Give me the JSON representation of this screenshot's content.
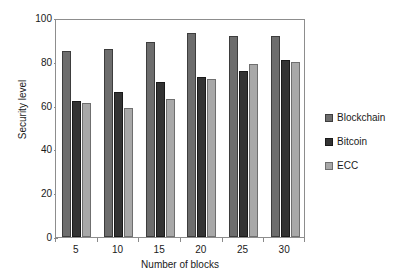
{
  "chart_data": {
    "type": "bar",
    "title": "",
    "xlabel": "Number of blocks",
    "ylabel": "Security level",
    "categories": [
      "5",
      "10",
      "15",
      "20",
      "25",
      "30"
    ],
    "series": [
      {
        "name": "Blockchain",
        "color": "#6d6d6d",
        "values": [
          85,
          86,
          89,
          93,
          92,
          92
        ]
      },
      {
        "name": "Bitcoin",
        "color": "#333333",
        "values": [
          62,
          66,
          71,
          73,
          76,
          81
        ]
      },
      {
        "name": "ECC",
        "color": "#a8a8a8",
        "values": [
          61,
          59,
          63,
          72,
          79,
          80
        ]
      }
    ],
    "ylim": [
      0,
      100
    ],
    "yticks": [
      0,
      20,
      40,
      60,
      80,
      100
    ],
    "ytick_labels": [
      "0",
      "20",
      "40",
      "60",
      "80",
      "100"
    ],
    "grid": false,
    "legend_position": "right",
    "frame": true
  },
  "legend": {
    "entries": [
      {
        "label": "Blockchain"
      },
      {
        "label": "Bitcoin"
      },
      {
        "label": "ECC"
      }
    ]
  }
}
